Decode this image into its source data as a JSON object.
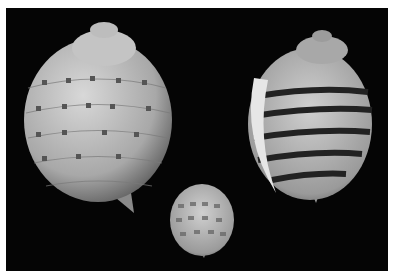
{
  "image": {
    "subject": "Three tun seashells (Tonna) on black background",
    "background_color": "#050505",
    "frame_color": "#ffffff",
    "shells": [
      {
        "name": "large-spotted-tun-shell",
        "pattern": "spotted bands",
        "color": "#b8b8b8"
      },
      {
        "name": "banded-tun-shell",
        "pattern": "dark stripes",
        "color": "#b0b0b0",
        "stripe_color": "#2a2a2a"
      },
      {
        "name": "small-spotted-tun-shell",
        "pattern": "checkered bands",
        "color": "#9a9a9a"
      }
    ]
  }
}
